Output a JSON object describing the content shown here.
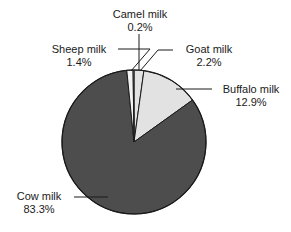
{
  "chart_data": {
    "type": "pie",
    "title": "",
    "xlabel": "",
    "ylabel": "",
    "categories": [
      "Goat milk",
      "Buffalo milk",
      "Cow milk",
      "Sheep milk",
      "Camel milk"
    ],
    "values": [
      2.2,
      12.9,
      83.3,
      1.4,
      0.2
    ],
    "value_unit": "%",
    "start_angle_deg": 0,
    "direction": "clockwise",
    "legend": "none",
    "labels_position": "outside-with-leader-lines",
    "grid": false,
    "slices": [
      {
        "label": "Goat milk",
        "value": 2.2,
        "value_text": "2.2%",
        "color": "#e2e2e2"
      },
      {
        "label": "Buffalo milk",
        "value": 12.9,
        "value_text": "12.9%",
        "color": "#e2e2e2"
      },
      {
        "label": "Cow milk",
        "value": 83.3,
        "value_text": "83.3%",
        "color": "#4d4d4d"
      },
      {
        "label": "Sheep milk",
        "value": 1.4,
        "value_text": "1.4%",
        "color": "#f2f2f2"
      },
      {
        "label": "Camel milk",
        "value": 0.2,
        "value_text": "0.2%",
        "color": "#d8d8d8"
      }
    ]
  },
  "colors": {
    "dark_slice": "#4d4d4d",
    "light_slice": "#e2e2e2",
    "pale_slice": "#f2f2f2",
    "outline": "#1a1a1a",
    "text": "#1a1a1a",
    "background": "#ffffff"
  },
  "callouts": {
    "camel": {
      "name": "Camel milk",
      "pct": "0.2%"
    },
    "sheep": {
      "name": "Sheep milk",
      "pct": "1.4%"
    },
    "goat": {
      "name": "Goat milk",
      "pct": "2.2%"
    },
    "buffalo": {
      "name": "Buffalo milk",
      "pct": "12.9%"
    },
    "cow": {
      "name": "Cow milk",
      "pct": "83.3%"
    }
  }
}
